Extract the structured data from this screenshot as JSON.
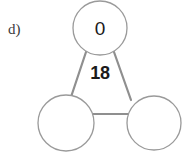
{
  "problem": {
    "label": "d)",
    "type": "number-triangle-puzzle"
  },
  "diagram": {
    "center_value": "18",
    "nodes": [
      {
        "id": "top",
        "value": "0",
        "filled": true
      },
      {
        "id": "bottom-left",
        "value": "",
        "filled": false
      },
      {
        "id": "bottom-right",
        "value": "",
        "filled": false
      }
    ],
    "edges": [
      {
        "from": "top",
        "to": "bottom-left"
      },
      {
        "from": "top",
        "to": "bottom-right"
      },
      {
        "from": "bottom-left",
        "to": "bottom-right"
      }
    ]
  },
  "style": {
    "background_color": "#ffffff",
    "circle_stroke_color": "#9a9a9a",
    "edge_stroke_color": "#8f8f8f",
    "text_color": "#1a1a1a",
    "label_color": "#3a3a3a"
  }
}
